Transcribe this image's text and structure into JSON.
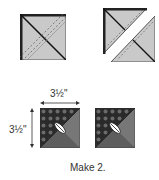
{
  "diagram": {
    "steps": [
      {
        "name": "sewn-square",
        "description": "Square with diagonal stitch lines"
      },
      {
        "name": "cut-square",
        "description": "Square cut on diagonal into two halves"
      }
    ],
    "result": {
      "width_label": "3½\"",
      "height_label": "3½\"",
      "count_label": "Make 2."
    },
    "colors": {
      "light_fabric": "#c8c8c8",
      "dark_fabric": "#2a2a2a",
      "mid_fabric": "#6a6a6a",
      "outline": "#1a1a1a"
    }
  }
}
